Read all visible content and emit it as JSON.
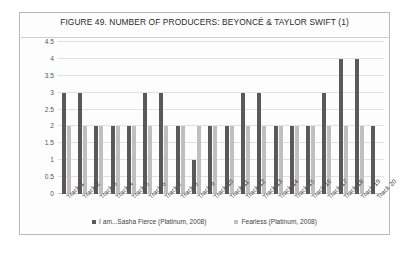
{
  "figure": {
    "title": "FIGURE 49. NUMBER OF PRODUCERS: BEYONCÉ & TAYLOR SWIFT (1)"
  },
  "chart_data": {
    "type": "bar",
    "title": "FIGURE 49. NUMBER OF PRODUCERS: BEYONCÉ & TAYLOR SWIFT (1)",
    "xlabel": "",
    "ylabel": "",
    "ylim": [
      0,
      4.5
    ],
    "yticks": [
      "0",
      "0.5",
      "1",
      "1.5",
      "2",
      "2.5",
      "3",
      "3.5",
      "4",
      "4.5"
    ],
    "ytick_values": [
      0,
      0.5,
      1,
      1.5,
      2,
      2.5,
      3,
      3.5,
      4,
      4.5
    ],
    "grid": true,
    "legend_position": "bottom",
    "categories": [
      "Track 1",
      "Track 2",
      "Track 3",
      "Track 4",
      "Track 5",
      "Track 6",
      "Track 7",
      "Track 8",
      "Track 9",
      "Track 10",
      "Track 11",
      "Track 12",
      "Track 13",
      "Track 14",
      "Track 15",
      "Track 16",
      "Track 17",
      "Track 18",
      "Track 19",
      "Track 20"
    ],
    "series": [
      {
        "name": "I am...Sasha Fierce (Platinum, 2008)",
        "color": "#595959",
        "values": [
          3,
          3,
          2,
          2,
          2,
          3,
          3,
          2,
          1,
          2,
          2,
          3,
          3,
          2,
          2,
          2,
          3,
          4,
          4,
          2
        ]
      },
      {
        "name": "Fearless (Platinum, 2008)",
        "color": "#bfbfbf",
        "values": [
          2,
          2,
          2,
          2,
          2,
          2,
          2,
          2,
          2,
          2,
          2,
          2,
          2,
          2,
          2,
          2,
          2,
          2,
          2,
          null
        ]
      }
    ]
  }
}
